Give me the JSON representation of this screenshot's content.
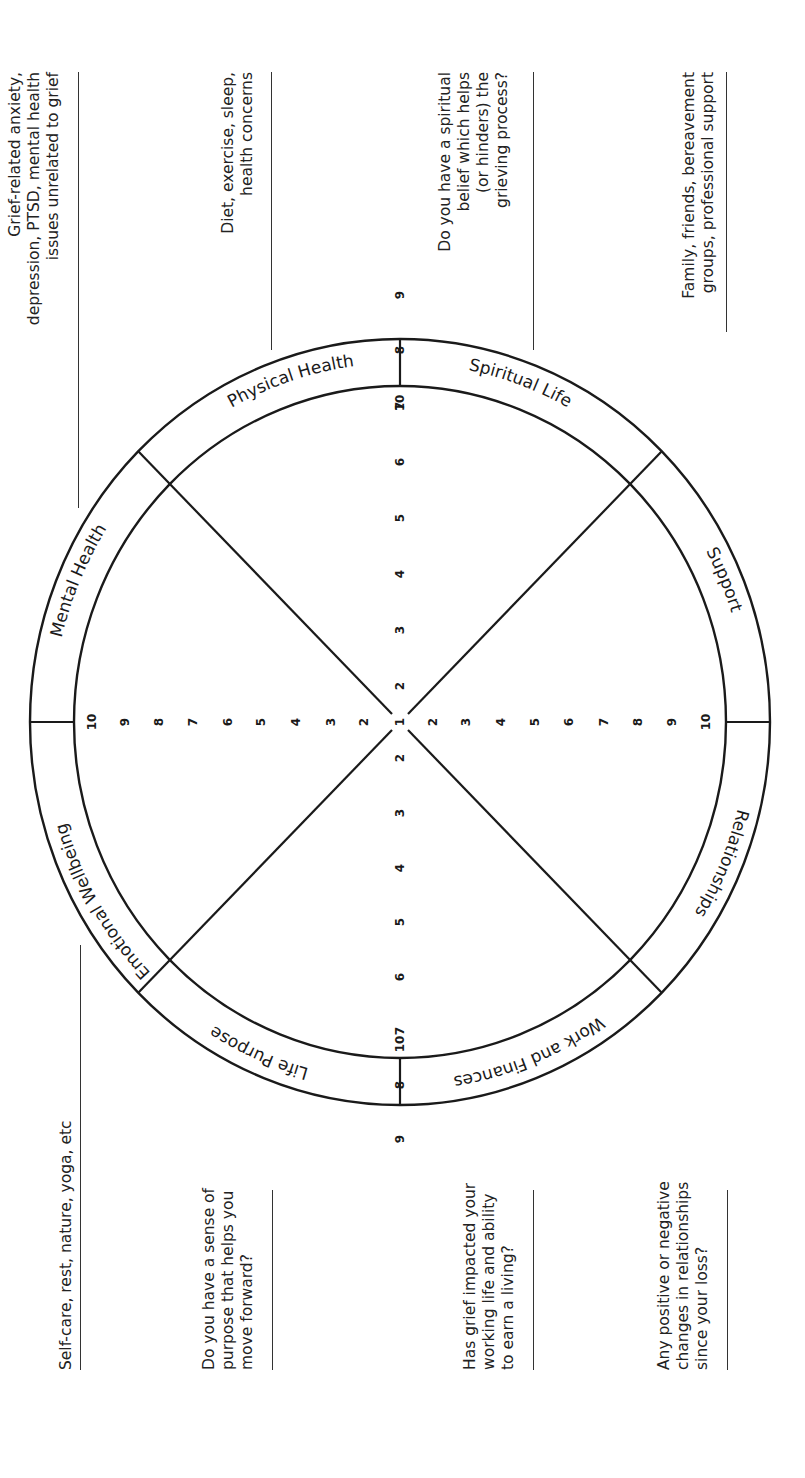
{
  "wheel": {
    "segments": [
      {
        "label": "Physical Health"
      },
      {
        "label": "Spiritual Life"
      },
      {
        "label": "Support"
      },
      {
        "label": "Relationships"
      },
      {
        "label": "Work and Finances"
      },
      {
        "label": "Life Purpose"
      },
      {
        "label": "Emotional Wellbeing"
      },
      {
        "label": "Mental Health"
      }
    ],
    "scale": [
      "1",
      "2",
      "3",
      "4",
      "5",
      "6",
      "7",
      "8",
      "9",
      "10"
    ]
  },
  "notes": {
    "mental_health": "Grief-related anxiety,\ndepression, PTSD, mental health\nissues unrelated to grief",
    "physical_health": "Diet, exercise, sleep,\nhealth concerns",
    "spiritual_life": "Do you have a spiritual\nbelief which helps\n(or hinders) the\ngrieving process?",
    "support": "Family, friends, bereavement\ngroups, professional support",
    "emotional_wellbeing": "Self-care, rest, nature, yoga, etc",
    "life_purpose": "Do you have a sense of\npurpose that helps you\nmove forward?",
    "work_finances": "Has grief impacted your\nworking life and ability\nto earn a living?",
    "relationships": "Any positive or negative\nchanges in relationships\nsince your loss?"
  }
}
